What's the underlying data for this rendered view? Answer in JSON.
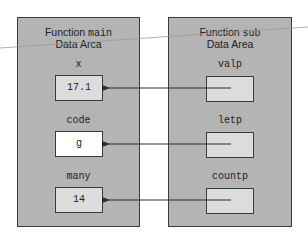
{
  "main_area": {
    "title_prefix": "Function ",
    "title_name": "main",
    "subtitle": "Data Arca",
    "variables": [
      {
        "name": "x",
        "value": "17.1"
      },
      {
        "name": "code",
        "value": "g"
      },
      {
        "name": "many",
        "value": "14"
      }
    ]
  },
  "sub_area": {
    "title_prefix": "Function ",
    "title_name": "sub",
    "subtitle": "Data Area",
    "variables": [
      {
        "name": "valp",
        "value": ""
      },
      {
        "name": "letp",
        "value": ""
      },
      {
        "name": "countp",
        "value": ""
      }
    ]
  },
  "colors": {
    "area_fill": "#b4b4b4",
    "cell_fill": "#dcdcdc",
    "highlight_cell_fill": "#ffffff",
    "stroke": "#3a3a3a"
  }
}
